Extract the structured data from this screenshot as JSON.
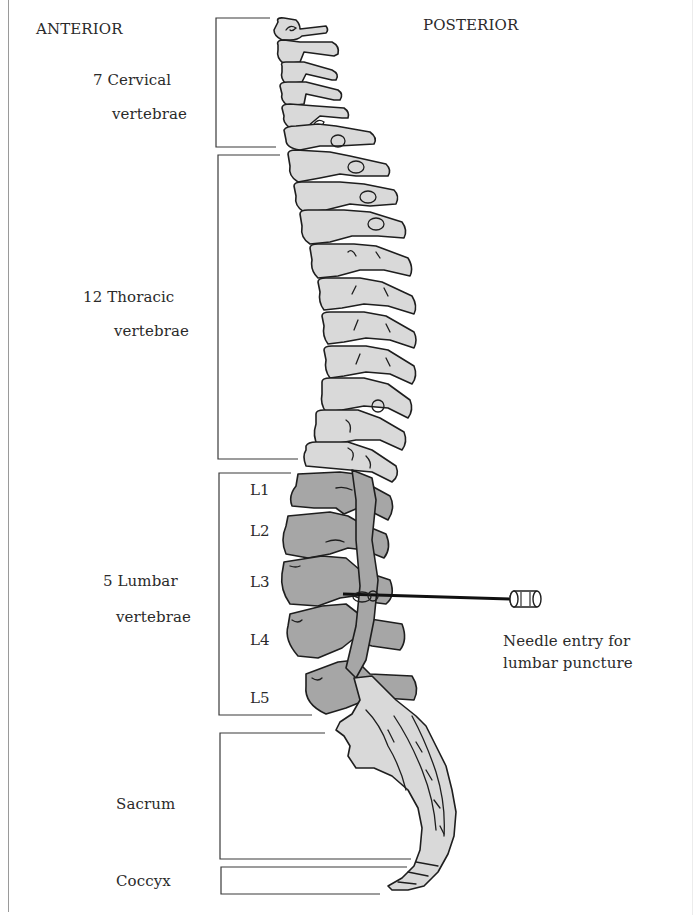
{
  "orientation": {
    "anterior_label": "ANTERIOR",
    "posterior_label": "POSTERIOR"
  },
  "regions": [
    {
      "id": "cervical",
      "line1": "7 Cervical",
      "line2": "vertebrae",
      "count": 7
    },
    {
      "id": "thoracic",
      "line1": "12 Thoracic",
      "line2": "vertebrae",
      "count": 12
    },
    {
      "id": "lumbar",
      "line1": "5 Lumbar",
      "line2": "vertebrae",
      "count": 5
    },
    {
      "id": "sacrum",
      "line1": "Sacrum"
    },
    {
      "id": "coccyx",
      "line1": "Coccyx"
    }
  ],
  "lumbar_levels": [
    "L1",
    "L2",
    "L3",
    "L4",
    "L5"
  ],
  "needle": {
    "caption_line1": "Needle entry for",
    "caption_line2": "lumbar puncture",
    "target_level": "L3-L4"
  },
  "colors": {
    "bone_fill": "#d9d9d9",
    "lumbar_fill": "#a6a6a6",
    "outline": "#1e1e1e"
  }
}
